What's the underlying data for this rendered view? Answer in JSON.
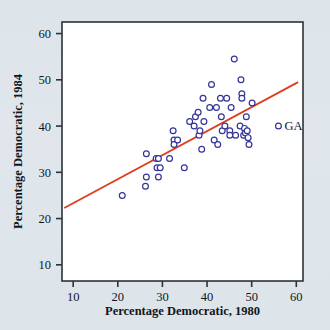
{
  "figure": {
    "background_color": "#dde4ea",
    "plot_background_color": "#ffffff",
    "frame_color": "#2b3338"
  },
  "chart_data": {
    "type": "scatter",
    "title": "",
    "xlabel": "Percentage Democratic, 1980",
    "ylabel": "Percentage Democratic, 1984",
    "xlim": [
      7.5,
      61.5
    ],
    "ylim": [
      6.5,
      62.5
    ],
    "xticks": [
      10,
      20,
      30,
      40,
      50,
      60
    ],
    "yticks": [
      10,
      20,
      30,
      40,
      50,
      60
    ],
    "xticklabels": [
      "10",
      "20",
      "30",
      "40",
      "50",
      "60"
    ],
    "yticklabels": [
      "10",
      "20",
      "30",
      "40",
      "50",
      "60"
    ],
    "grid": false,
    "legend": null,
    "marker": {
      "shape": "open-circle",
      "edge_color": "#333399",
      "face_color": "#ffffff",
      "radius_px": 2.9,
      "edge_width_px": 1.2
    },
    "points": [
      {
        "x": 21.0,
        "y": 25.0
      },
      {
        "x": 26.4,
        "y": 34.0
      },
      {
        "x": 26.4,
        "y": 29.0
      },
      {
        "x": 26.2,
        "y": 27.0
      },
      {
        "x": 28.6,
        "y": 33.0
      },
      {
        "x": 29.1,
        "y": 33.0
      },
      {
        "x": 28.8,
        "y": 31.0
      },
      {
        "x": 29.5,
        "y": 31.0
      },
      {
        "x": 29.1,
        "y": 29.0
      },
      {
        "x": 31.6,
        "y": 33.0
      },
      {
        "x": 32.4,
        "y": 39.0
      },
      {
        "x": 32.6,
        "y": 37.0
      },
      {
        "x": 32.6,
        "y": 36.0
      },
      {
        "x": 33.4,
        "y": 37.0
      },
      {
        "x": 34.9,
        "y": 31.0
      },
      {
        "x": 36.1,
        "y": 41.0
      },
      {
        "x": 37.1,
        "y": 40.0
      },
      {
        "x": 37.4,
        "y": 42.0
      },
      {
        "x": 38.0,
        "y": 43.0
      },
      {
        "x": 38.2,
        "y": 38.0
      },
      {
        "x": 38.4,
        "y": 39.0
      },
      {
        "x": 38.8,
        "y": 35.0
      },
      {
        "x": 39.1,
        "y": 46.0
      },
      {
        "x": 39.3,
        "y": 41.0
      },
      {
        "x": 40.6,
        "y": 44.0
      },
      {
        "x": 41.0,
        "y": 49.0
      },
      {
        "x": 41.6,
        "y": 37.0
      },
      {
        "x": 42.1,
        "y": 44.0
      },
      {
        "x": 42.4,
        "y": 36.0
      },
      {
        "x": 43.0,
        "y": 46.0
      },
      {
        "x": 43.2,
        "y": 42.0
      },
      {
        "x": 43.4,
        "y": 39.0
      },
      {
        "x": 44.0,
        "y": 40.0
      },
      {
        "x": 44.4,
        "y": 46.0
      },
      {
        "x": 45.1,
        "y": 39.0
      },
      {
        "x": 45.1,
        "y": 38.0
      },
      {
        "x": 45.4,
        "y": 44.0
      },
      {
        "x": 46.1,
        "y": 54.5
      },
      {
        "x": 46.4,
        "y": 38.0
      },
      {
        "x": 47.4,
        "y": 40.0
      },
      {
        "x": 47.6,
        "y": 50.0
      },
      {
        "x": 47.8,
        "y": 47.0
      },
      {
        "x": 47.8,
        "y": 46.0
      },
      {
        "x": 48.2,
        "y": 38.0
      },
      {
        "x": 48.4,
        "y": 39.5
      },
      {
        "x": 48.6,
        "y": 38.5
      },
      {
        "x": 48.8,
        "y": 42.0
      },
      {
        "x": 49.0,
        "y": 39.0
      },
      {
        "x": 49.2,
        "y": 37.5
      },
      {
        "x": 49.4,
        "y": 36.0
      },
      {
        "x": 50.1,
        "y": 45.0
      },
      {
        "x": 56.0,
        "y": 40.0,
        "label": "GA"
      }
    ],
    "trendline": {
      "color": "#e03c1e",
      "width_px": 1.8,
      "x0": 8.0,
      "y0": 22.3,
      "x1": 60.4,
      "y1": 49.5
    },
    "annotations": [
      {
        "text": "GA",
        "x": 56.0,
        "y": 40.0,
        "dx_px": 6,
        "dy_px": 4
      }
    ]
  }
}
